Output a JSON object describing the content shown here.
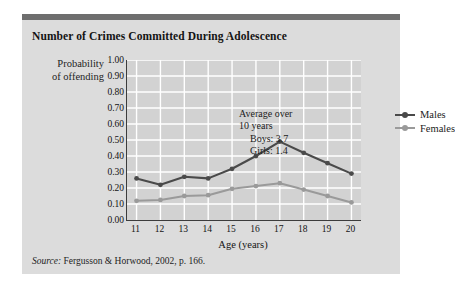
{
  "card": {
    "title": "Number of Crimes Committed During Adolescence",
    "source_label": "Source:",
    "source_text": " Fergusson & Horwood, 2002, p. 166.",
    "header_bar_color": "#6e6e6e",
    "background_color": "#dcdcdc"
  },
  "chart_data": {
    "type": "line",
    "title": "Number of Crimes Committed During Adolescence",
    "xlabel": "Age (years)",
    "ylabel": "Probability of offending",
    "ylabel_line1": "Probability",
    "ylabel_line2": "of offending",
    "x": [
      11,
      12,
      13,
      14,
      15,
      16,
      17,
      18,
      19,
      20
    ],
    "categories": [
      "11",
      "12",
      "13",
      "14",
      "15",
      "16",
      "17",
      "18",
      "19",
      "20"
    ],
    "xlim": [
      10.6,
      20.4
    ],
    "ylim": [
      0.0,
      1.0
    ],
    "yticks": [
      0.0,
      0.1,
      0.2,
      0.3,
      0.4,
      0.5,
      0.6,
      0.7,
      0.8,
      0.9,
      1.0
    ],
    "ytick_labels": [
      "1.00",
      "0.90",
      "0.80",
      "0.70",
      "0.60",
      "0.50",
      "0.40",
      "0.30",
      "0.20",
      "0.10",
      "0.00"
    ],
    "grid": true,
    "grid_color": "#ffffff",
    "plot_background": "#d2d2d2",
    "legend_position": "upper right",
    "series": [
      {
        "name": "Males",
        "color": "#4a4a4a",
        "values": [
          0.26,
          0.22,
          0.27,
          0.26,
          0.32,
          0.4,
          0.49,
          0.42,
          0.355,
          0.29
        ]
      },
      {
        "name": "Females",
        "color": "#9a9a9a",
        "values": [
          0.12,
          0.125,
          0.15,
          0.155,
          0.195,
          0.212,
          0.23,
          0.19,
          0.15,
          0.11
        ]
      }
    ],
    "annotations": [
      {
        "text": "Average over",
        "indent": false
      },
      {
        "text": "10 years",
        "indent": false
      },
      {
        "text": "Boys: 3.7",
        "indent": true
      },
      {
        "text": "Girls: 1.4",
        "indent": true
      }
    ]
  }
}
